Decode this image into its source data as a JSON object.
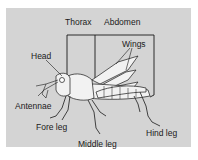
{
  "diagram": {
    "labels": {
      "thorax": "Thorax",
      "abdomen": "Abdomen",
      "wings": "Wings",
      "head": "Head",
      "antennae": "Antennae",
      "fore_leg": "Fore leg",
      "middle_leg": "Middle leg",
      "hind_leg": "Hind leg"
    },
    "colors": {
      "background": "#d4d4d4",
      "ink": "#1a1a1a",
      "body_fill": "#f2f2f2"
    }
  }
}
